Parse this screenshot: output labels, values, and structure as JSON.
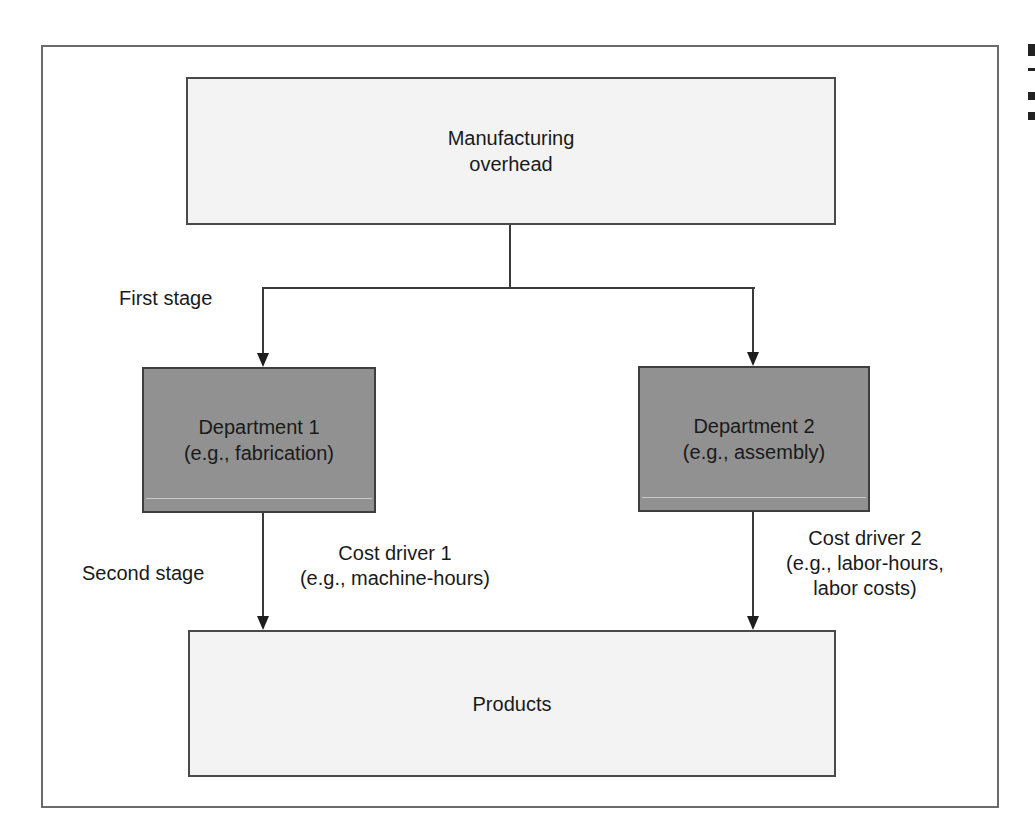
{
  "diagram": {
    "type": "two-stage overhead cost allocation flowchart",
    "nodes": {
      "overhead": {
        "label": "Manufacturing\noverhead"
      },
      "department1": {
        "label": "Department 1\n(e.g., fabrication)"
      },
      "department2": {
        "label": "Department 2\n(e.g., assembly)"
      },
      "products": {
        "label": "Products"
      }
    },
    "stage_labels": {
      "first": "First stage",
      "second": "Second stage"
    },
    "edge_labels": {
      "cost_driver_1": "Cost driver 1\n(e.g., machine-hours)",
      "cost_driver_2": "Cost driver 2\n(e.g., labor-hours,\nlabor costs)"
    },
    "edges": [
      {
        "from": "overhead",
        "to": "department1",
        "stage": "first"
      },
      {
        "from": "overhead",
        "to": "department2",
        "stage": "first"
      },
      {
        "from": "department1",
        "to": "products",
        "stage": "second",
        "label": "cost_driver_1"
      },
      {
        "from": "department2",
        "to": "products",
        "stage": "second",
        "label": "cost_driver_2"
      }
    ]
  },
  "colors": {
    "light_box_fill": "#f3f3f3",
    "dark_box_fill": "#919191",
    "line": "#3a3a3a",
    "frame": "#6a6a6a"
  }
}
